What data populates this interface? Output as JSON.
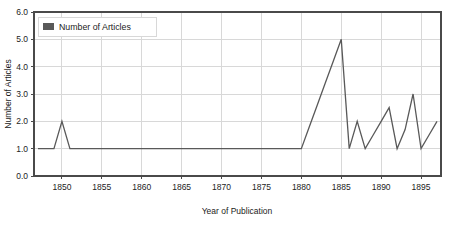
{
  "chart_data": {
    "type": "line",
    "title": "",
    "subtitle": "",
    "xlabel": "Year of Publication",
    "ylabel": "Number of Articles",
    "xlim": [
      1846.5,
      1897.5
    ],
    "ylim": [
      0.0,
      6.0
    ],
    "grid": true,
    "legend_position": "top-left",
    "legend": [
      "Number of Articles"
    ],
    "xticks": [
      1850,
      1855,
      1860,
      1865,
      1870,
      1875,
      1880,
      1885,
      1890,
      1895
    ],
    "xtick_labels": [
      "1850",
      "1855",
      "1860",
      "1865",
      "1870",
      "1875",
      "1880",
      "1885",
      "1890",
      "1895"
    ],
    "yticks": [
      0.0,
      1.0,
      2.0,
      3.0,
      4.0,
      5.0,
      6.0
    ],
    "ytick_labels": [
      "0.0",
      "1.0",
      "2.0",
      "3.0",
      "4.0",
      "5.0",
      "6.0"
    ],
    "series": [
      {
        "name": "Number of Articles",
        "color": "#595959",
        "x": [
          1847,
          1848,
          1849,
          1850,
          1851,
          1852,
          1853,
          1854,
          1855,
          1856,
          1857,
          1858,
          1859,
          1860,
          1861,
          1862,
          1863,
          1864,
          1865,
          1866,
          1867,
          1868,
          1869,
          1870,
          1871,
          1872,
          1873,
          1874,
          1875,
          1876,
          1877,
          1878,
          1879,
          1880,
          1881,
          1882,
          1883,
          1884,
          1885,
          1886,
          1887,
          1888,
          1889,
          1890,
          1891,
          1892,
          1893,
          1894,
          1895,
          1896,
          1897
        ],
        "values": [
          1,
          1,
          1,
          2,
          1,
          1,
          1,
          1,
          1,
          1,
          1,
          1,
          1,
          1,
          1,
          1,
          1,
          1,
          1,
          1,
          1,
          1,
          1,
          1,
          1,
          1,
          1,
          1,
          1,
          1,
          1,
          1,
          1,
          1,
          1.8,
          2.6,
          3.4,
          4.2,
          5,
          1,
          2,
          1,
          1.5,
          2,
          2.5,
          1,
          1.7,
          3,
          1,
          1.5,
          2
        ]
      }
    ]
  },
  "legend": {
    "swatch_color": "#595959",
    "label": "Number of Articles"
  },
  "colors": {
    "series": "#595959",
    "grid": "#d8d8d8",
    "axis": "#4a4a4a",
    "text": "#1b1b1b",
    "background": "#ffffff"
  },
  "axes": {
    "x_title": "Year of Publication",
    "y_title": "Number of Articles"
  },
  "y_tick_labels": [
    "6.0",
    "5.0",
    "4.0",
    "3.0",
    "2.0",
    "1.0",
    "0.0"
  ],
  "x_tick_labels": [
    "1850",
    "1855",
    "1860",
    "1865",
    "1870",
    "1875",
    "1880",
    "1885",
    "1890",
    "1895"
  ]
}
